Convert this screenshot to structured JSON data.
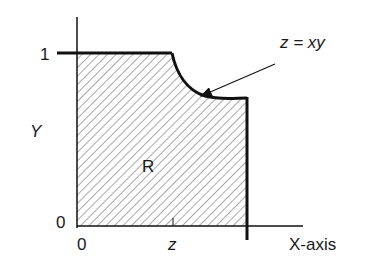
{
  "diagram": {
    "region_label": "R",
    "y_axis_label": "Y",
    "x_axis_label": "X-axis",
    "y_tick_top": "1",
    "y_tick_bottom": "0",
    "x_tick_origin": "0",
    "x_tick_z": "z",
    "curve_annotation": "z = xy",
    "colors": {
      "line": "#111111",
      "hatch": "#555555",
      "background": "#ffffff"
    }
  }
}
